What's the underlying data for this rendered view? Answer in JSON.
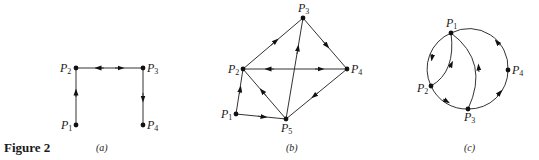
{
  "figure": {
    "title": "Figure 2",
    "panels": [
      {
        "id": "a",
        "caption": "(a)",
        "nodes": [
          {
            "name": "P",
            "sub": "1"
          },
          {
            "name": "P",
            "sub": "2"
          },
          {
            "name": "P",
            "sub": "3"
          },
          {
            "name": "P",
            "sub": "4"
          }
        ],
        "edges": [
          {
            "from": "P1",
            "to": "P2"
          },
          {
            "from": "P2",
            "to": "P3"
          },
          {
            "from": "P3",
            "to": "P2"
          },
          {
            "from": "P3",
            "to": "P4"
          }
        ]
      },
      {
        "id": "b",
        "caption": "(b)",
        "nodes": [
          {
            "name": "P",
            "sub": "1"
          },
          {
            "name": "P",
            "sub": "2"
          },
          {
            "name": "P",
            "sub": "3"
          },
          {
            "name": "P",
            "sub": "4"
          },
          {
            "name": "P",
            "sub": "5"
          }
        ],
        "edges": [
          {
            "from": "P1",
            "to": "P2"
          },
          {
            "from": "P1",
            "to": "P5"
          },
          {
            "from": "P2",
            "to": "P3"
          },
          {
            "from": "P3",
            "to": "P4"
          },
          {
            "from": "P2",
            "to": "P4"
          },
          {
            "from": "P4",
            "to": "P2"
          },
          {
            "from": "P4",
            "to": "P5"
          },
          {
            "from": "P5",
            "to": "P2"
          },
          {
            "from": "P5",
            "to": "P3"
          }
        ]
      },
      {
        "id": "c",
        "caption": "(c)",
        "nodes": [
          {
            "name": "P",
            "sub": "1"
          },
          {
            "name": "P",
            "sub": "2"
          },
          {
            "name": "P",
            "sub": "3"
          },
          {
            "name": "P",
            "sub": "4"
          }
        ],
        "edges": [
          {
            "from": "P1",
            "to": "P2"
          },
          {
            "from": "P2",
            "to": "P1"
          },
          {
            "from": "P2",
            "to": "P3"
          },
          {
            "from": "P3",
            "to": "P1"
          },
          {
            "from": "P3",
            "to": "P4"
          },
          {
            "from": "P4",
            "to": "P1"
          }
        ]
      }
    ]
  }
}
